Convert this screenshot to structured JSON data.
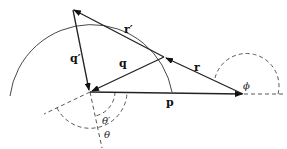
{
  "diagram": {
    "type": "vector-scattering-geometry",
    "labels": {
      "r_prime": "r′",
      "q_prime": "q′",
      "q": "q",
      "r": "r",
      "p": "p",
      "phi": "ϕ",
      "theta_prime": "θ′",
      "theta": "θ"
    },
    "vectors": [
      {
        "name": "r′",
        "from": "middle",
        "to": "top"
      },
      {
        "name": "q′",
        "from": "top",
        "to": "origin"
      },
      {
        "name": "q",
        "from": "middle",
        "to": "origin"
      },
      {
        "name": "r",
        "from": "right",
        "to": "middle"
      },
      {
        "name": "p",
        "from": "origin",
        "to": "right"
      }
    ],
    "angles": [
      "ϕ",
      "θ′",
      "θ"
    ],
    "colors": {
      "stroke": "#222222",
      "background": "#ffffff"
    }
  }
}
